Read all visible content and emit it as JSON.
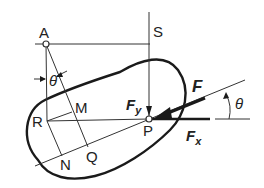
{
  "diagram": {
    "points": {
      "A": "A",
      "S": "S",
      "R": "R",
      "M": "M",
      "N": "N",
      "Q": "Q",
      "P": "P"
    },
    "forces": {
      "F": "F",
      "Fy_main": "F",
      "Fy_sub": "y",
      "Fx_main": "F",
      "Fx_sub": "x"
    },
    "angles": {
      "theta_left": "θ",
      "theta_right": "θ"
    },
    "colors": {
      "line": "#333333",
      "thick": "#1a1a1a",
      "background": "#ffffff"
    }
  }
}
